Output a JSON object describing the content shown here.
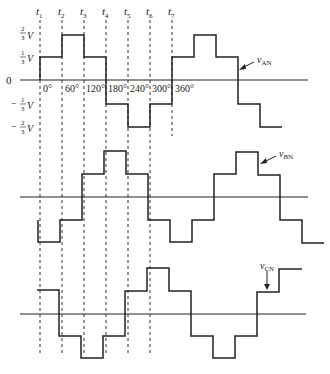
{
  "diagram": {
    "time_markers": [
      {
        "label": "t",
        "sub": "1",
        "x": 40
      },
      {
        "label": "t",
        "sub": "2",
        "x": 62
      },
      {
        "label": "t",
        "sub": "3",
        "x": 84
      },
      {
        "label": "t",
        "sub": "4",
        "x": 106
      },
      {
        "label": "t",
        "sub": "5",
        "x": 128
      },
      {
        "label": "t",
        "sub": "6",
        "x": 150
      },
      {
        "label": "t",
        "sub": "7",
        "x": 172
      }
    ],
    "y_axis_labels": [
      {
        "text": "2/3 V",
        "num": "2",
        "den": "3",
        "sign": ""
      },
      {
        "text": "1/3 V",
        "num": "1",
        "den": "3",
        "sign": ""
      },
      {
        "text": "0"
      },
      {
        "text": "-1/3 V",
        "num": "1",
        "den": "3",
        "sign": "−"
      },
      {
        "text": "-2/3 V",
        "num": "2",
        "den": "3",
        "sign": "−"
      }
    ],
    "angle_labels": [
      "0°",
      "60°",
      "120°",
      "180°",
      "240°",
      "300°",
      "360°"
    ],
    "waveforms": [
      {
        "name": "v_AN",
        "label": "v",
        "sub": "AN",
        "levels_per_60deg": [
          "1/3",
          "2/3",
          "1/3",
          "-1/3",
          "-2/3",
          "-1/3",
          "1/3",
          "2/3",
          "1/3",
          "-1/3",
          "-2/3"
        ]
      },
      {
        "name": "v_BN",
        "label": "v",
        "sub": "BN",
        "levels_per_60deg": [
          "-2/3",
          "-1/3",
          "1/3",
          "2/3",
          "1/3",
          "-1/3",
          "-2/3",
          "-1/3",
          "1/3",
          "2/3",
          "1/3",
          "-1/3",
          "-2/3"
        ]
      },
      {
        "name": "v_CN",
        "label": "v",
        "sub": "CN",
        "levels_per_60deg": [
          "1/3",
          "-1/3",
          "-2/3",
          "-1/3",
          "1/3",
          "2/3",
          "1/3",
          "-1/3",
          "-2/3",
          "-1/3",
          "1/3",
          "2/3"
        ]
      }
    ]
  }
}
